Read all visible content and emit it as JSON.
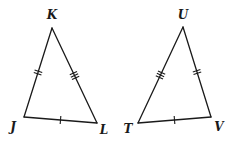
{
  "diagram": {
    "type": "geometry-congruent-triangles",
    "triangles": [
      {
        "name": "triangle-JKL",
        "vertices": {
          "K": {
            "label": "K",
            "x": 52,
            "y": 28,
            "label_x": 52,
            "label_y": 19
          },
          "J": {
            "label": "J",
            "x": 24,
            "y": 117,
            "label_x": 13,
            "label_y": 131
          },
          "L": {
            "label": "L",
            "x": 97,
            "y": 123,
            "label_x": 104,
            "label_y": 134
          }
        },
        "sides": [
          {
            "from": "J",
            "to": "K",
            "tick_marks": 2
          },
          {
            "from": "K",
            "to": "L",
            "tick_marks": 3
          },
          {
            "from": "J",
            "to": "L",
            "tick_marks": 1
          }
        ]
      },
      {
        "name": "triangle-TUV",
        "vertices": {
          "U": {
            "label": "U",
            "x": 183,
            "y": 27,
            "label_x": 183,
            "label_y": 19
          },
          "T": {
            "label": "T",
            "x": 138,
            "y": 123,
            "label_x": 128,
            "label_y": 133
          },
          "V": {
            "label": "V",
            "x": 211,
            "y": 117,
            "label_x": 219,
            "label_y": 131
          }
        },
        "sides": [
          {
            "from": "T",
            "to": "U",
            "tick_marks": 3
          },
          {
            "from": "U",
            "to": "V",
            "tick_marks": 2
          },
          {
            "from": "T",
            "to": "V",
            "tick_marks": 1
          }
        ]
      }
    ],
    "labels": {
      "K": "K",
      "J": "J",
      "L": "L",
      "U": "U",
      "T": "T",
      "V": "V"
    }
  }
}
